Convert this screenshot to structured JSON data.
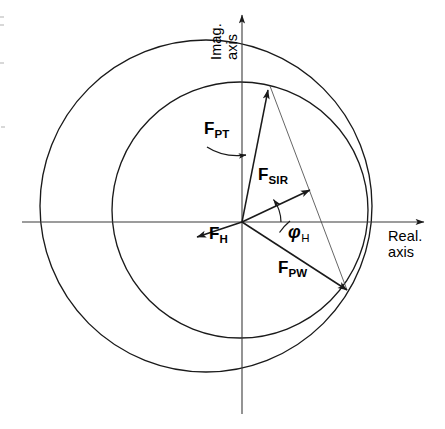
{
  "figure": {
    "background_color": "#ffffff",
    "stroke_color": "#1a1a1a",
    "width": 445,
    "height": 429
  },
  "axes": {
    "imaginary": {
      "label_line1": "Imag.",
      "label_line2": "axis",
      "label": "Imag. axis",
      "orientation": "vertical"
    },
    "real": {
      "label_line1": "Real.",
      "label_line2": "axis",
      "label": "Real. axis",
      "orientation": "horizontal"
    },
    "origin": {
      "x": 242,
      "y": 222
    }
  },
  "vectors": [
    {
      "id": "pt",
      "symbol": "F",
      "subscript": "PT",
      "label": "F PT",
      "from": {
        "x": 242,
        "y": 222
      },
      "to": {
        "x": 268,
        "y": 90
      },
      "label_pos": {
        "x": 204,
        "y": 119
      },
      "leader": true
    },
    {
      "id": "sir",
      "symbol": "F",
      "subscript": "SIR",
      "label": "F SIR",
      "from": {
        "x": 242,
        "y": 222
      },
      "to": {
        "x": 310,
        "y": 190
      },
      "label_pos": {
        "x": 258,
        "y": 165
      },
      "leader": false
    },
    {
      "id": "h",
      "symbol": "F",
      "subscript": "H",
      "label": "F H",
      "from": {
        "x": 242,
        "y": 222
      },
      "to": {
        "x": 197,
        "y": 237
      },
      "label_pos": {
        "x": 209,
        "y": 224
      },
      "leader": false
    },
    {
      "id": "pw",
      "symbol": "F",
      "subscript": "PW",
      "label": "F PW",
      "from": {
        "x": 242,
        "y": 222
      },
      "to": {
        "x": 347,
        "y": 290
      },
      "label_pos": {
        "x": 278,
        "y": 258
      },
      "leader": false
    }
  ],
  "angle": {
    "id": "phi-h",
    "symbol": "φ",
    "subscript": "H",
    "label": "φ H",
    "label_pos": {
      "x": 287,
      "y": 222
    },
    "arc_radius": 38,
    "between": [
      "real-axis",
      "sir"
    ]
  },
  "circles": [
    {
      "id": "outer-circle",
      "center": {
        "x": 206,
        "y": 206
      },
      "radius": 166
    },
    {
      "id": "inner-circle",
      "center": {
        "x": 240,
        "y": 210
      },
      "radius": 128
    }
  ],
  "chord": {
    "id": "intersection-chord",
    "from": {
      "x": 270,
      "y": 86
    },
    "to": {
      "x": 347,
      "y": 290
    }
  }
}
